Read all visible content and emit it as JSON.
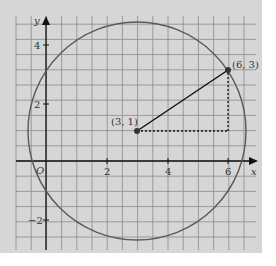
{
  "figure": {
    "axes": {
      "x_label": "x",
      "y_label": "y",
      "origin_label": "O"
    },
    "x_ticks": [
      {
        "value": 2,
        "label": "2"
      },
      {
        "value": 4,
        "label": "4"
      },
      {
        "value": 6,
        "label": "6"
      }
    ],
    "y_ticks": [
      {
        "value": 4,
        "label": "4"
      },
      {
        "value": 2,
        "label": "2"
      },
      {
        "value": -2,
        "label": "−2"
      }
    ],
    "points": [
      {
        "name": "center",
        "label": "(3, 1)",
        "x": 3,
        "y": 1
      },
      {
        "name": "on-circle",
        "label": "(6, 3)",
        "x": 6,
        "y": 3
      }
    ],
    "circle": {
      "center": [
        3,
        1
      ],
      "radius_squared": 13
    },
    "colors": {
      "background": "#d6d6d6",
      "grid": "#8a8a8a",
      "circle": "#555555",
      "axis": "#111111"
    }
  }
}
